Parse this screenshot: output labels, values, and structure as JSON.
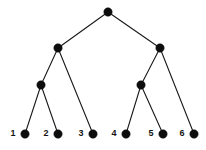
{
  "figure": {
    "kind": "binary-tree-diagram",
    "title": "",
    "width": 206,
    "height": 150,
    "background_color": "#ffffff",
    "node_color": "#0d0d0d",
    "edge_color": "#1a1a1a",
    "label_color": "#141414",
    "node_radius": 4.2,
    "edge_width": 1.1,
    "label_font_size": 9,
    "label_font_weight": "bold"
  },
  "nodes": [
    {
      "id": "root",
      "x": 108,
      "y": 12,
      "label": "",
      "level": 0,
      "is_leaf": false
    },
    {
      "id": "n-l",
      "x": 58,
      "y": 48,
      "label": "",
      "level": 1,
      "is_leaf": false
    },
    {
      "id": "n-r",
      "x": 160,
      "y": 48,
      "label": "",
      "level": 1,
      "is_leaf": false
    },
    {
      "id": "n-ll",
      "x": 41,
      "y": 85,
      "label": "",
      "level": 2,
      "is_leaf": false
    },
    {
      "id": "n-rl",
      "x": 141,
      "y": 85,
      "label": "",
      "level": 2,
      "is_leaf": false
    },
    {
      "id": "leaf-1",
      "x": 25,
      "y": 134,
      "label": "1",
      "level": 3,
      "is_leaf": true
    },
    {
      "id": "leaf-2",
      "x": 58,
      "y": 134,
      "label": "2",
      "level": 3,
      "is_leaf": true
    },
    {
      "id": "leaf-3",
      "x": 93,
      "y": 134,
      "label": "3",
      "level": 3,
      "is_leaf": true
    },
    {
      "id": "leaf-4",
      "x": 126,
      "y": 134,
      "label": "4",
      "level": 3,
      "is_leaf": true
    },
    {
      "id": "leaf-5",
      "x": 163,
      "y": 134,
      "label": "5",
      "level": 3,
      "is_leaf": true
    },
    {
      "id": "leaf-6",
      "x": 194,
      "y": 134,
      "label": "6",
      "level": 3,
      "is_leaf": true
    }
  ],
  "edges": [
    {
      "from": "root",
      "to": "n-l",
      "x1": 108,
      "y1": 12,
      "x2": 58,
      "y2": 48
    },
    {
      "from": "root",
      "to": "n-r",
      "x1": 108,
      "y1": 12,
      "x2": 160,
      "y2": 48
    },
    {
      "from": "n-l",
      "to": "n-ll",
      "x1": 58,
      "y1": 48,
      "x2": 41,
      "y2": 85
    },
    {
      "from": "n-l",
      "to": "leaf-3",
      "x1": 58,
      "y1": 48,
      "x2": 93,
      "y2": 134
    },
    {
      "from": "n-r",
      "to": "n-rl",
      "x1": 160,
      "y1": 48,
      "x2": 141,
      "y2": 85
    },
    {
      "from": "n-r",
      "to": "leaf-6",
      "x1": 160,
      "y1": 48,
      "x2": 194,
      "y2": 134
    },
    {
      "from": "n-ll",
      "to": "leaf-1",
      "x1": 41,
      "y1": 85,
      "x2": 25,
      "y2": 134
    },
    {
      "from": "n-ll",
      "to": "leaf-2",
      "x1": 41,
      "y1": 85,
      "x2": 58,
      "y2": 134
    },
    {
      "from": "n-rl",
      "to": "leaf-4",
      "x1": 141,
      "y1": 85,
      "x2": 126,
      "y2": 134
    },
    {
      "from": "n-rl",
      "to": "leaf-5",
      "x1": 141,
      "y1": 85,
      "x2": 163,
      "y2": 134
    }
  ],
  "labels": [
    {
      "for": "leaf-1",
      "text": "1",
      "x": 13,
      "y": 134
    },
    {
      "for": "leaf-2",
      "text": "2",
      "x": 46,
      "y": 134
    },
    {
      "for": "leaf-3",
      "text": "3",
      "x": 81,
      "y": 134
    },
    {
      "for": "leaf-4",
      "text": "4",
      "x": 114,
      "y": 134
    },
    {
      "for": "leaf-5",
      "text": "5",
      "x": 151,
      "y": 134
    },
    {
      "for": "leaf-6",
      "text": "6",
      "x": 182,
      "y": 134
    }
  ]
}
